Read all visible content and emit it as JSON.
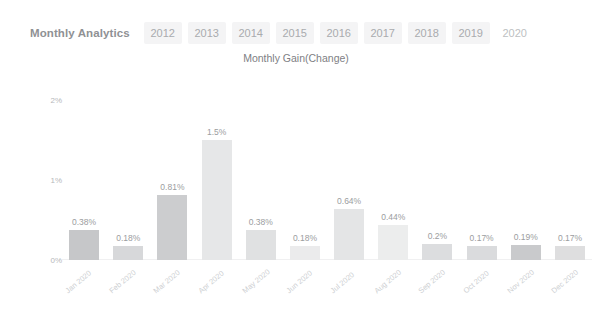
{
  "header": {
    "title": "Monthly Analytics",
    "tabs": [
      {
        "label": "2012",
        "active": false
      },
      {
        "label": "2013",
        "active": false
      },
      {
        "label": "2014",
        "active": false
      },
      {
        "label": "2015",
        "active": false
      },
      {
        "label": "2016",
        "active": false
      },
      {
        "label": "2017",
        "active": false
      },
      {
        "label": "2018",
        "active": false
      },
      {
        "label": "2019",
        "active": false
      },
      {
        "label": "2020",
        "active": true
      }
    ]
  },
  "chart_data": {
    "type": "bar",
    "title": "Monthly Gain(Change)",
    "xlabel": "",
    "ylabel": "",
    "ylim": [
      0,
      2
    ],
    "grid": false,
    "legend": false,
    "ytick_labels": [
      "0%",
      "1%",
      "2%"
    ],
    "ytick_values": [
      0,
      1,
      2
    ],
    "categories": [
      "Jan 2020",
      "Feb 2020",
      "Mar 2020",
      "Apr 2020",
      "May 2020",
      "Jun 2020",
      "Jul 2020",
      "Aug 2020",
      "Sep 2020",
      "Oct 2020",
      "Nov 2020",
      "Dec 2020"
    ],
    "values": [
      0.38,
      0.18,
      0.81,
      1.5,
      0.38,
      0.18,
      0.64,
      0.44,
      0.2,
      0.17,
      0.19,
      0.17
    ],
    "data_labels": [
      "0.38%",
      "0.18%",
      "0.81%",
      "1.5%",
      "0.38%",
      "0.18%",
      "0.64%",
      "0.44%",
      "0.2%",
      "0.17%",
      "0.19%",
      "0.17%"
    ],
    "bar_colors": [
      "#c6c7c9",
      "#d7d8da",
      "#cccdcf",
      "#e6e7e8",
      "#e0e1e2",
      "#ebebec",
      "#e4e5e6",
      "#eceded",
      "#dcdddf",
      "#dadbdd",
      "#c9cacc",
      "#dededf"
    ]
  },
  "colors": {
    "tab_background": "#f4f4f5",
    "tab_text": "#a9abae",
    "title_text": "#8f9194",
    "axis_text": "#b6b8bb",
    "label_text": "#9b9da0",
    "xlabel_text": "#cdcfd2",
    "page_background": "#ffffff"
  }
}
